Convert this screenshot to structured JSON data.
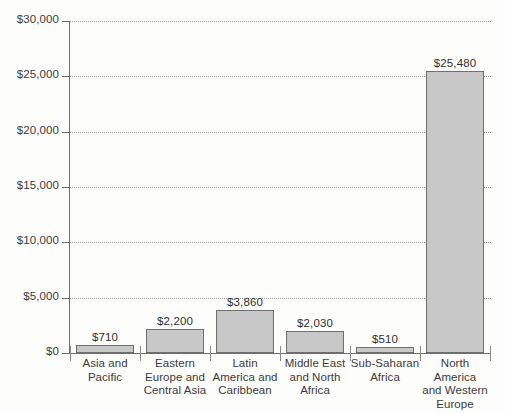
{
  "chart_data": {
    "type": "bar",
    "title": "",
    "subtitle": "",
    "xlabel": "",
    "ylabel": "",
    "categories": [
      "Asia and Pacific",
      "Eastern Europe and Central Asia",
      "Latin America and Caribbean",
      "Middle East and North Africa",
      "Sub-Saharan Africa",
      "North America and Western Europe"
    ],
    "category_lines": [
      [
        "Asia and",
        "Pacific"
      ],
      [
        "Eastern",
        "Europe and",
        "Central Asia"
      ],
      [
        "Latin",
        "America and",
        "Caribbean"
      ],
      [
        "Middle East",
        "and North",
        "Africa"
      ],
      [
        "Sub-Saharan",
        "Africa"
      ],
      [
        "North",
        "America",
        "and Western",
        "Europe"
      ]
    ],
    "values": [
      710,
      2200,
      3860,
      2030,
      510,
      25480
    ],
    "value_labels": [
      "$710",
      "$2,200",
      "$3,860",
      "$2,030",
      "$510",
      "$25,480"
    ],
    "ylim": [
      0,
      30000
    ],
    "ytick_values": [
      0,
      5000,
      10000,
      15000,
      20000,
      25000,
      30000
    ],
    "ytick_labels": [
      "$0",
      "$5,000",
      "$10,000",
      "$15,000",
      "$20,000",
      "$25,000",
      "$30,000"
    ],
    "grid": true,
    "grid_style": "dotted-horizontal",
    "legend": null,
    "bar_fill_color": "#c8c8c8",
    "bar_border_color": "#6f6f6f",
    "axis_color": "#6d6d6d",
    "grid_color": "#9a9a9a",
    "text_color": "#3b3b3b",
    "background_color": "#fdfdfc"
  }
}
